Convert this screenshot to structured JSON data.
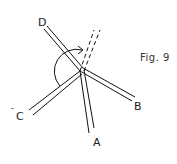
{
  "figure": {
    "caption": "Fig. 9",
    "labels": {
      "a": "A",
      "b": "B",
      "c": "C",
      "d": "D",
      "c_mark": "-",
      "b_mark": "-"
    }
  },
  "colors": {
    "line": "#111111",
    "background": "#ffffff"
  }
}
